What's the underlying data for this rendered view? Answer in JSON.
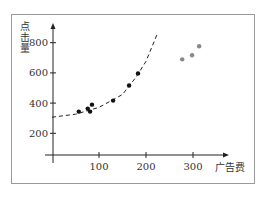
{
  "chart_data": {
    "type": "scatter",
    "title": "",
    "xlabel": "广告费",
    "ylabel": "点击量",
    "xlim": [
      0,
      330
    ],
    "ylim": [
      0,
      900
    ],
    "x_ticks": [
      100,
      200,
      300
    ],
    "y_ticks": [
      200,
      400,
      600,
      800
    ],
    "grid": false,
    "legend": null,
    "series": [
      {
        "name": "fitted points",
        "color": "#111111",
        "points": [
          [
            57,
            347
          ],
          [
            76,
            367
          ],
          [
            81,
            347
          ],
          [
            85,
            393
          ],
          [
            130,
            420
          ],
          [
            164,
            520
          ],
          [
            183,
            600
          ]
        ]
      },
      {
        "name": "outliers",
        "color": "#888888",
        "points": [
          [
            277,
            693
          ],
          [
            298,
            720
          ],
          [
            313,
            780
          ]
        ]
      }
    ],
    "trend_line": {
      "style": "dashed",
      "shape": "exponential",
      "x_range": [
        0,
        225
      ],
      "points": [
        [
          0,
          310
        ],
        [
          50,
          330
        ],
        [
          100,
          375
        ],
        [
          150,
          460
        ],
        [
          180,
          580
        ],
        [
          200,
          680
        ],
        [
          225,
          870
        ]
      ]
    }
  }
}
